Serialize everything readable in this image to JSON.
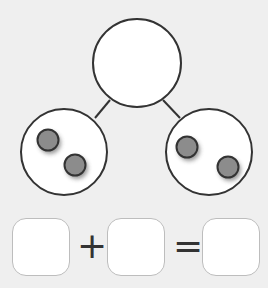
{
  "diagram": {
    "type": "number-bond",
    "whole": {
      "value": "",
      "dots": 0
    },
    "parts": [
      {
        "value": "",
        "dots": 2
      },
      {
        "value": "",
        "dots": 2
      }
    ],
    "colors": {
      "background": "#efefef",
      "stroke": "#333333",
      "dot_fill": "#8c8c8c",
      "box_border": "#bdbdbd"
    }
  },
  "equation": {
    "boxes": [
      "",
      "",
      ""
    ],
    "plus": "+",
    "equals": "="
  }
}
